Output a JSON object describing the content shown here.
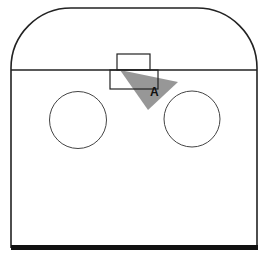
{
  "diagram": {
    "colors": {
      "background": "#ffffff",
      "line": "#222222",
      "shaded_area": "#8c8c8c"
    },
    "labels": {
      "point_a": "A"
    },
    "elements": {
      "rink_outline": "rounded rink boundary",
      "goal_line": "horizontal line",
      "goal_net": "small rectangle above goal line",
      "goal_crease": "rectangle below goal line",
      "left_faceoff_circle": "circle",
      "right_faceoff_circle": "circle",
      "shaded_zone": "grey triangular region from goal toward point A",
      "blue_line": "thick bottom line"
    }
  }
}
